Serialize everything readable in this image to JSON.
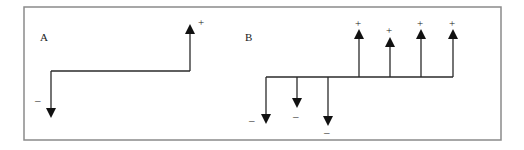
{
  "figure": {
    "frame": {
      "x": 24,
      "y": 7,
      "width": 477,
      "height": 133
    },
    "colors": {
      "frame": "#8a8a8a",
      "line": "#2a2a2a",
      "arrowhead": "#111111"
    }
  },
  "panels": [
    {
      "id": "A",
      "label": "A",
      "label_pos": [
        40,
        41
      ],
      "baseline_y": 71,
      "baseline_x": [
        51,
        190
      ],
      "arrows": [
        {
          "x": 51,
          "direction": "down",
          "tip_y": 118,
          "sign": "–",
          "sign_pos": [
            35,
            104
          ]
        },
        {
          "x": 190,
          "direction": "up",
          "tip_y": 24,
          "sign": "+",
          "sign_pos": [
            198,
            26
          ]
        }
      ]
    },
    {
      "id": "B",
      "label": "B",
      "label_pos": [
        245,
        41
      ],
      "baseline_y": 77,
      "baseline_x": [
        266,
        453
      ],
      "arrows": [
        {
          "x": 266,
          "direction": "down",
          "tip_y": 124,
          "sign": "–",
          "sign_pos": [
            249,
            124
          ]
        },
        {
          "x": 297,
          "direction": "down",
          "tip_y": 108,
          "sign": "–",
          "sign_pos": [
            293,
            120
          ]
        },
        {
          "x": 328,
          "direction": "down",
          "tip_y": 126,
          "sign": "–",
          "sign_pos": [
            324,
            136
          ]
        },
        {
          "x": 359,
          "direction": "up",
          "tip_y": 29,
          "sign": "+",
          "sign_pos": [
            355,
            27
          ]
        },
        {
          "x": 390,
          "direction": "up",
          "tip_y": 37,
          "sign": "+",
          "sign_pos": [
            386,
            34
          ]
        },
        {
          "x": 421,
          "direction": "up",
          "tip_y": 29,
          "sign": "+",
          "sign_pos": [
            417,
            27
          ]
        },
        {
          "x": 453,
          "direction": "up",
          "tip_y": 29,
          "sign": "+",
          "sign_pos": [
            449,
            27
          ]
        }
      ]
    }
  ]
}
